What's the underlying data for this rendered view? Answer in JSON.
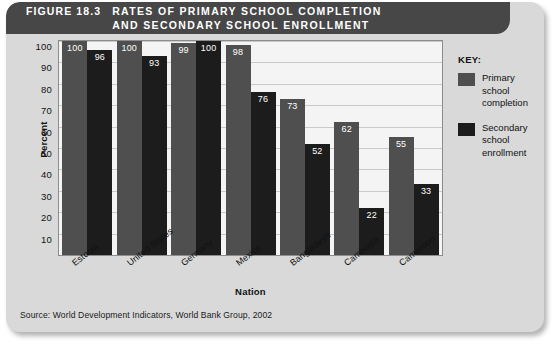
{
  "figure": {
    "number_label": "FIGURE 18.3",
    "title": "RATES OF PRIMARY SCHOOL COMPLETION\nAND SECONDARY SCHOOL ENROLLMENT",
    "source": "Source: World Development Indicators, World Bank Group, 2002"
  },
  "legend": {
    "title": "KEY:",
    "items": [
      {
        "label": "Primary school\ncompletion",
        "color": "#4f4f4f"
      },
      {
        "label": "Secondary\nschool\nenrollment",
        "color": "#1c1c1c"
      }
    ]
  },
  "colors": {
    "primary_bar": "#4f4f4f",
    "secondary_bar": "#1c1c1c",
    "card_background": "#d9d9d9",
    "title_bar": "#474747",
    "plot_background": "#f4f4f4",
    "gridline": "#c9c9c9"
  },
  "chart_data": {
    "type": "bar",
    "title": "RATES OF PRIMARY SCHOOL COMPLETION AND SECONDARY SCHOOL ENROLLMENT",
    "xlabel": "Nation",
    "ylabel": "Percent",
    "ylim": [
      0,
      100
    ],
    "yticks": [
      10,
      20,
      30,
      40,
      50,
      60,
      70,
      80,
      90,
      100
    ],
    "grid": true,
    "legend_position": "right",
    "categories": [
      "Estonia",
      "United States",
      "Germany",
      "Mexico",
      "Bangladesh",
      "Cambodia",
      "Cameroon"
    ],
    "series": [
      {
        "name": "Primary school completion",
        "color": "#4f4f4f",
        "values": [
          100,
          100,
          99,
          98,
          73,
          62,
          55
        ]
      },
      {
        "name": "Secondary school enrollment",
        "color": "#1c1c1c",
        "values": [
          96,
          93,
          100,
          76,
          52,
          22,
          33
        ]
      }
    ]
  }
}
